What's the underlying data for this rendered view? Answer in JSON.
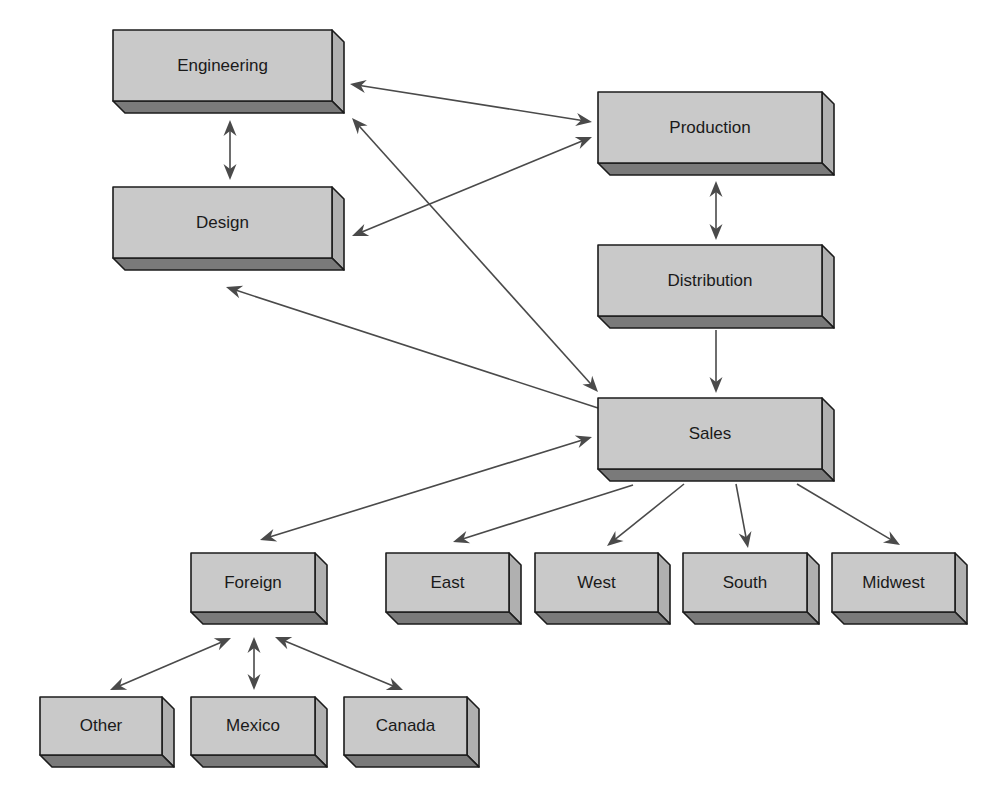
{
  "diagram": {
    "type": "organization-flow",
    "colors": {
      "front_face": "#c9c9c9",
      "bottom_face": "#7a7a7a",
      "side_face": "#b0b0b0",
      "outline": "#1c1c1c",
      "arrow": "#4a4a4a",
      "text": "#1a1a1a"
    },
    "nodes": [
      {
        "id": "engineering",
        "label": "Engineering",
        "x": 113,
        "y": 30,
        "w": 219,
        "h": 71,
        "depth": 12
      },
      {
        "id": "design",
        "label": "Design",
        "x": 113,
        "y": 187,
        "w": 219,
        "h": 71,
        "depth": 12
      },
      {
        "id": "production",
        "label": "Production",
        "x": 598,
        "y": 92,
        "w": 224,
        "h": 71,
        "depth": 12
      },
      {
        "id": "distribution",
        "label": "Distribution",
        "x": 598,
        "y": 245,
        "w": 224,
        "h": 71,
        "depth": 12
      },
      {
        "id": "sales",
        "label": "Sales",
        "x": 598,
        "y": 398,
        "w": 224,
        "h": 71,
        "depth": 12
      },
      {
        "id": "foreign",
        "label": "Foreign",
        "x": 191,
        "y": 553,
        "w": 124,
        "h": 59,
        "depth": 12
      },
      {
        "id": "east",
        "label": "East",
        "x": 386,
        "y": 553,
        "w": 123,
        "h": 59,
        "depth": 12
      },
      {
        "id": "west",
        "label": "West",
        "x": 535,
        "y": 553,
        "w": 123,
        "h": 59,
        "depth": 12
      },
      {
        "id": "south",
        "label": "South",
        "x": 683,
        "y": 553,
        "w": 124,
        "h": 59,
        "depth": 12
      },
      {
        "id": "midwest",
        "label": "Midwest",
        "x": 832,
        "y": 553,
        "w": 123,
        "h": 59,
        "depth": 12
      },
      {
        "id": "other",
        "label": "Other",
        "x": 40,
        "y": 697,
        "w": 122,
        "h": 58,
        "depth": 12
      },
      {
        "id": "mexico",
        "label": "Mexico",
        "x": 191,
        "y": 697,
        "w": 124,
        "h": 58,
        "depth": 12
      },
      {
        "id": "canada",
        "label": "Canada",
        "x": 344,
        "y": 697,
        "w": 123,
        "h": 58,
        "depth": 12
      }
    ],
    "edges": [
      {
        "from": "engineering",
        "to": "production",
        "bidirectional": true,
        "x1": 350,
        "y1": 84,
        "x2": 592,
        "y2": 122
      },
      {
        "from": "engineering",
        "to": "design",
        "bidirectional": true,
        "x1": 230,
        "y1": 120,
        "x2": 230,
        "y2": 180
      },
      {
        "from": "design",
        "to": "production",
        "bidirectional": true,
        "x1": 352,
        "y1": 236,
        "x2": 592,
        "y2": 137
      },
      {
        "from": "engineering",
        "to": "sales",
        "bidirectional": true,
        "x1": 352,
        "y1": 118,
        "x2": 598,
        "y2": 392
      },
      {
        "from": "sales",
        "to": "design",
        "bidirectional": false,
        "x1": 598,
        "y1": 408,
        "x2": 226,
        "y2": 287
      },
      {
        "from": "production",
        "to": "distribution",
        "bidirectional": true,
        "x1": 716,
        "y1": 181,
        "x2": 716,
        "y2": 240
      },
      {
        "from": "distribution",
        "to": "sales",
        "bidirectional": false,
        "x1": 716,
        "y1": 330,
        "x2": 716,
        "y2": 393
      },
      {
        "from": "foreign",
        "to": "sales",
        "bidirectional": true,
        "x1": 260,
        "y1": 540,
        "x2": 592,
        "y2": 437
      },
      {
        "from": "sales",
        "to": "east",
        "bidirectional": false,
        "x1": 633,
        "y1": 485,
        "x2": 453,
        "y2": 542
      },
      {
        "from": "sales",
        "to": "west",
        "bidirectional": false,
        "x1": 684,
        "y1": 484,
        "x2": 607,
        "y2": 546
      },
      {
        "from": "sales",
        "to": "south",
        "bidirectional": false,
        "x1": 736,
        "y1": 484,
        "x2": 748,
        "y2": 548
      },
      {
        "from": "sales",
        "to": "midwest",
        "bidirectional": false,
        "x1": 797,
        "y1": 484,
        "x2": 900,
        "y2": 545
      },
      {
        "from": "foreign",
        "to": "other",
        "bidirectional": true,
        "x1": 231,
        "y1": 638,
        "x2": 110,
        "y2": 690
      },
      {
        "from": "foreign",
        "to": "mexico",
        "bidirectional": true,
        "x1": 254,
        "y1": 637,
        "x2": 254,
        "y2": 690
      },
      {
        "from": "foreign",
        "to": "canada",
        "bidirectional": true,
        "x1": 275,
        "y1": 637,
        "x2": 403,
        "y2": 690
      }
    ]
  }
}
